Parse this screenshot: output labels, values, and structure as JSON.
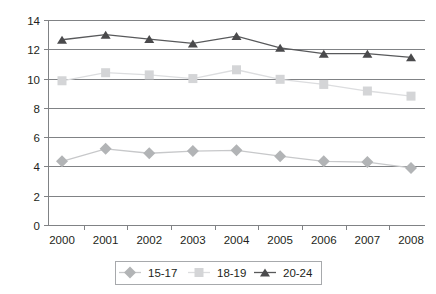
{
  "chart_data": {
    "type": "line",
    "title": "",
    "subtitle": "",
    "xlabel": "",
    "ylabel": "",
    "categories": [
      "2000",
      "2001",
      "2002",
      "2003",
      "2004",
      "2005",
      "2006",
      "2007",
      "2008"
    ],
    "x": [
      2000,
      2001,
      2002,
      2003,
      2004,
      2005,
      2006,
      2007,
      2008
    ],
    "ylim": [
      0,
      14
    ],
    "yticks": [
      0,
      2,
      4,
      6,
      8,
      10,
      12,
      14
    ],
    "ytick_labels": [
      "0",
      "2",
      "4",
      "6",
      "8",
      "10",
      "12",
      "14"
    ],
    "grid": "horizontal",
    "legend_position": "bottom",
    "series": [
      {
        "name": "15-17",
        "marker": "diamond",
        "color": "#b2b4b6",
        "line_color": "#c7c8ca",
        "values": [
          4.35,
          5.2,
          4.9,
          5.05,
          5.1,
          4.7,
          4.35,
          4.3,
          3.9
        ]
      },
      {
        "name": "18-19",
        "marker": "square",
        "color": "#d4d5d7",
        "line_color": "#dcdddf",
        "values": [
          9.85,
          10.4,
          10.25,
          10.0,
          10.6,
          9.95,
          9.6,
          9.15,
          8.8
        ]
      },
      {
        "name": "20-24",
        "marker": "triangle",
        "color": "#4a4a4c",
        "line_color": "#58595b",
        "values": [
          12.65,
          13.0,
          12.7,
          12.4,
          12.9,
          12.1,
          11.7,
          11.7,
          11.45
        ]
      }
    ]
  },
  "legend": {
    "items": [
      {
        "label": "15-17"
      },
      {
        "label": "18-19"
      },
      {
        "label": "20-24"
      }
    ]
  },
  "axes": {
    "y_labels": [
      "14",
      "12",
      "10",
      "8",
      "6",
      "4",
      "2",
      "0"
    ],
    "x_labels": [
      "2000",
      "2001",
      "2002",
      "2003",
      "2004",
      "2005",
      "2006",
      "2007",
      "2008"
    ]
  },
  "colors": {
    "grid": "#808285",
    "axis": "#808285",
    "text": "#231f20",
    "background": "#ffffff",
    "legend_border": "#a7a9ac"
  }
}
